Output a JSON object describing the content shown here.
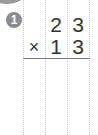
{
  "problem": {
    "number": "1",
    "multiplicand": [
      "",
      "2",
      "3"
    ],
    "multiplier_row": [
      "×",
      "1",
      "3"
    ],
    "operator": "×"
  },
  "colors": {
    "badge": "#8c8c8c",
    "grid": "#c8c8c8",
    "rule": "#7a7a7a",
    "digits": "#333333"
  }
}
